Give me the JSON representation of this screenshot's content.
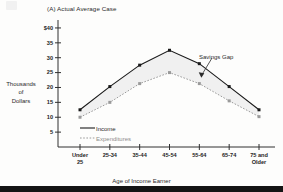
{
  "chart_data": {
    "type": "line",
    "title": "(A) Actual Average Case",
    "xlabel": "Age of Income Earner",
    "ylabel_lines": [
      "Thousands",
      "of",
      "Dollars"
    ],
    "categories": [
      "Under 25",
      "25-34",
      "35-44",
      "45-54",
      "55-64",
      "65-74",
      "75 and Older"
    ],
    "category_lines": [
      [
        "Under",
        "25"
      ],
      [
        "25-34",
        ""
      ],
      [
        "35-44",
        ""
      ],
      [
        "45-54",
        ""
      ],
      [
        "55-64",
        ""
      ],
      [
        "65-74",
        ""
      ],
      [
        "75 and",
        "Older"
      ]
    ],
    "series": [
      {
        "name": "Income",
        "style": "solid",
        "marker": "square",
        "color": "#1a1a1a",
        "values": [
          12.5,
          20.3,
          27.5,
          32.5,
          28.0,
          20.3,
          12.5
        ]
      },
      {
        "name": "Expenditures",
        "style": "dotted",
        "marker": "square",
        "color": "#9a9a9a",
        "values": [
          10.0,
          15.0,
          21.3,
          25.0,
          21.3,
          15.5,
          10.2
        ]
      }
    ],
    "ylim": [
      0,
      42
    ],
    "yticks": [
      5,
      10,
      15,
      20,
      25,
      30,
      35,
      40
    ],
    "ytick_labels": [
      "5",
      "10",
      "15",
      "20",
      "25",
      "30",
      "35",
      "$40"
    ],
    "grid": false,
    "legend_position": "inside-lower-left",
    "annotations": [
      {
        "text": "Savings Gap",
        "points_to": "gap band between Income and Expenditures at 55-64"
      }
    ],
    "shaded_region": {
      "label": "Savings Gap",
      "between": [
        "Income",
        "Expenditures"
      ],
      "fill": "#ededed"
    }
  },
  "legend": {
    "income_label": "Income",
    "expenditures_label": "Expenditures"
  }
}
